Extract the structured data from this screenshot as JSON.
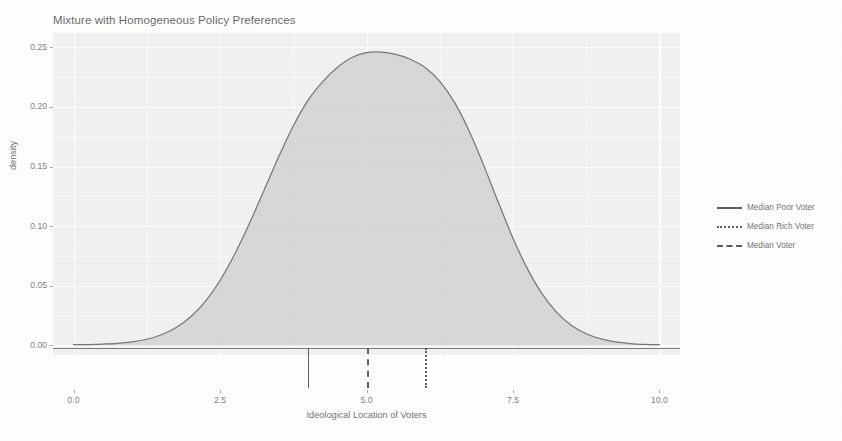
{
  "chart_data": {
    "type": "area",
    "title": "Mixture with Homogeneous Policy Preferences",
    "xlabel": "Ideological Location of Voters",
    "ylabel": "density",
    "xlim": [
      -0.35,
      10.35
    ],
    "ylim": [
      -0.008,
      0.262
    ],
    "grid": true,
    "legend_position": "right",
    "x_ticks": [
      "0.0",
      "2.5",
      "5.0",
      "7.5",
      "10.0"
    ],
    "x_tick_values": [
      0.0,
      2.5,
      5.0,
      7.5,
      10.0
    ],
    "y_ticks": [
      "0.00",
      "0.05",
      "0.10",
      "0.15",
      "0.20",
      "0.25"
    ],
    "y_tick_values": [
      0.0,
      0.05,
      0.1,
      0.15,
      0.2,
      0.25
    ],
    "series": [
      {
        "name": "density",
        "kind": "density-area",
        "fill_color": "#c9c9c9",
        "line_color": "#3a3a3a",
        "x": [
          0.0,
          0.25,
          0.5,
          0.75,
          1.0,
          1.25,
          1.5,
          1.75,
          2.0,
          2.25,
          2.5,
          2.75,
          3.0,
          3.25,
          3.5,
          3.75,
          4.0,
          4.25,
          4.5,
          4.75,
          5.0,
          5.25,
          5.5,
          5.75,
          6.0,
          6.25,
          6.5,
          6.75,
          7.0,
          7.25,
          7.5,
          7.75,
          8.0,
          8.25,
          8.5,
          8.75,
          9.0,
          9.25,
          9.5,
          9.75,
          10.0
        ],
        "y": [
          0.0006,
          0.0008,
          0.0012,
          0.0018,
          0.003,
          0.0052,
          0.009,
          0.015,
          0.024,
          0.037,
          0.0545,
          0.0765,
          0.102,
          0.13,
          0.158,
          0.184,
          0.2055,
          0.221,
          0.233,
          0.2415,
          0.2455,
          0.246,
          0.244,
          0.24,
          0.233,
          0.2215,
          0.204,
          0.18,
          0.151,
          0.12,
          0.09,
          0.064,
          0.043,
          0.0275,
          0.0168,
          0.0098,
          0.0055,
          0.003,
          0.0016,
          0.0009,
          0.0006
        ]
      }
    ],
    "markers": [
      {
        "name": "Median Poor Voter",
        "x": 4.0,
        "linetype": "solid",
        "color": "#333333"
      },
      {
        "name": "Median Voter",
        "x": 5.0,
        "linetype": "dashed",
        "color": "#333333"
      },
      {
        "name": "Median Rich Voter",
        "x": 6.0,
        "linetype": "dotted",
        "color": "#333333"
      }
    ],
    "peak": {
      "x": 5.2,
      "y": 0.246
    }
  },
  "legend": {
    "items": [
      {
        "label": "Median Poor Voter",
        "linetype": "solid"
      },
      {
        "label": "Median Rich Voter",
        "linetype": "dotted"
      },
      {
        "label": "Median Voter",
        "linetype": "dashed"
      }
    ]
  },
  "colors": {
    "panel_background": "#ededed",
    "grid": "#ffffff",
    "area_fill": "#c9c9c9",
    "curve": "#3a3a3a",
    "text": "#4a4a4a"
  }
}
